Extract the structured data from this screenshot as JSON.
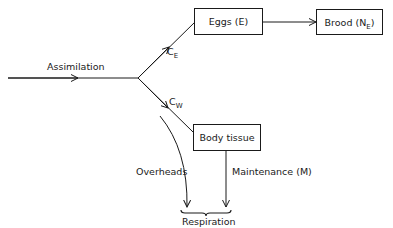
{
  "diagram": {
    "nodes": {
      "eggs": {
        "label": "Eggs (E)"
      },
      "brood": {
        "label": "Brood (N",
        "subscript": "E",
        "suffix": ")"
      },
      "body_tissue": {
        "label": "Body tissue"
      }
    },
    "edges": {
      "assimilation": {
        "label": "Assimilation"
      },
      "to_eggs": {
        "label": "C",
        "subscript": "E"
      },
      "to_body": {
        "label": "C",
        "subscript": "W"
      },
      "overheads": {
        "label": "Overheads"
      },
      "maintenance": {
        "label": "Maintenance (M)"
      }
    },
    "respiration": {
      "label": "Respiration"
    },
    "colors": {
      "stroke": "#1a1a1a",
      "background": "#ffffff"
    }
  }
}
